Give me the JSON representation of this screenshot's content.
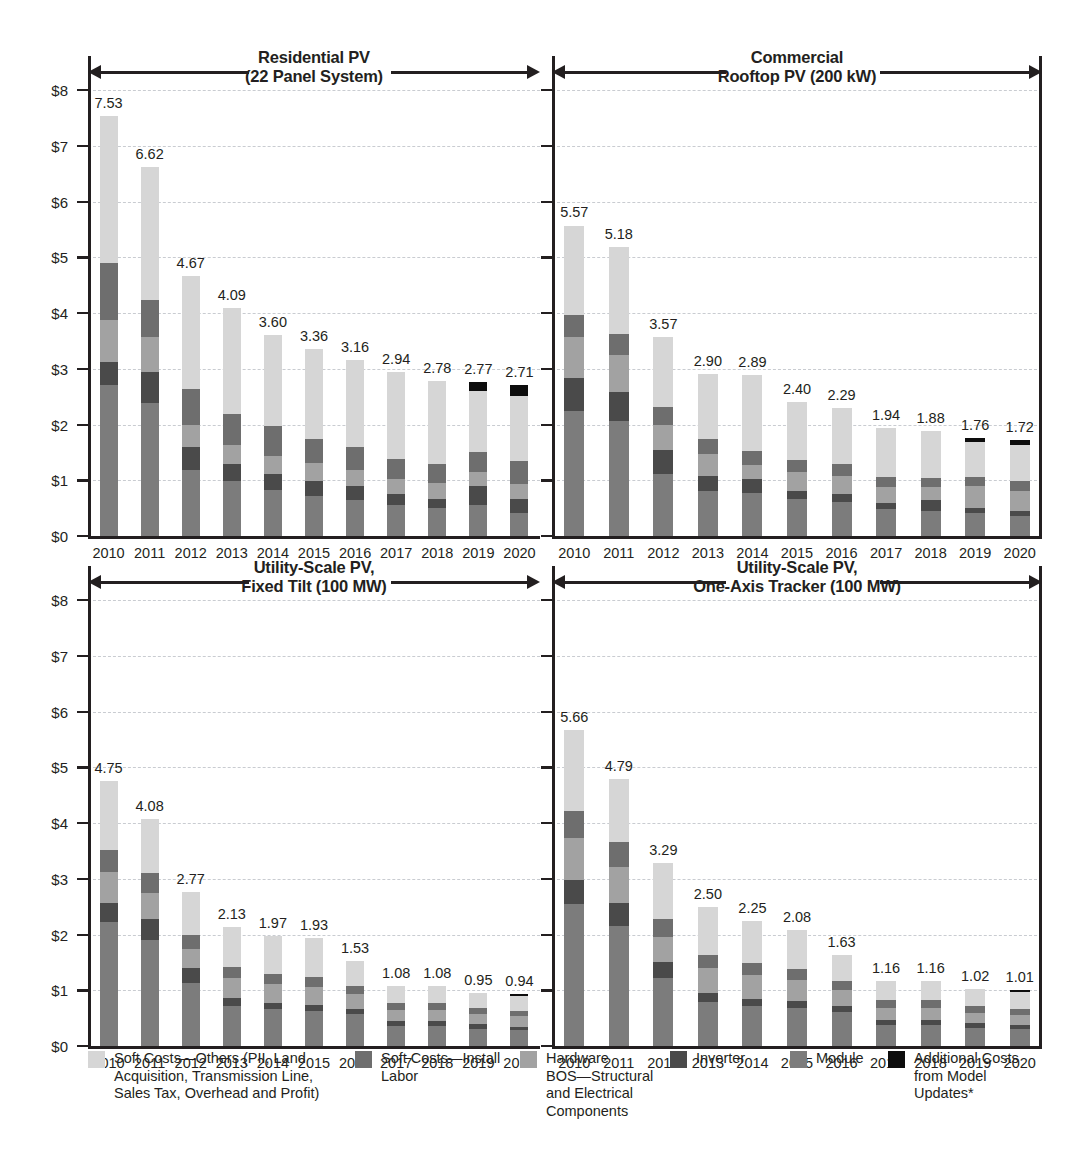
{
  "figure": {
    "y_axis": {
      "ticks": [
        "$0",
        "$1",
        "$2",
        "$3",
        "$4",
        "$5",
        "$6",
        "$7",
        "$8"
      ],
      "min": 0,
      "max": 8
    },
    "x_axis": {
      "categories": [
        "2010",
        "2011",
        "2012",
        "2013",
        "2014",
        "2015",
        "2016",
        "2017",
        "2018",
        "2019",
        "2020"
      ]
    }
  },
  "colors": {
    "soft_costs_others": "#d6d6d6",
    "soft_costs_install_labor": "#6e6e6e",
    "hardware_bos": "#a2a2a2",
    "inverter": "#4a4a4a",
    "module": "#7c7c7c",
    "additional_costs": "#0d0d0d",
    "text": "#231f20",
    "gridline": "#c9ccd1"
  },
  "legend": {
    "items": [
      {
        "name": "soft-costs-others",
        "label": "Soft Costs—Others (PII, Land\nAcquisition, Transmission Line,\nSales Tax, Overhead and Profit)",
        "color": "#d6d6d6"
      },
      {
        "name": "soft-costs-install-labor",
        "label": "Soft Costs—Install\nLabor",
        "color": "#6e6e6e"
      },
      {
        "name": "hardware-bos",
        "label": "Hardware\nBOS—Structural\nand Electrical\nComponents",
        "color": "#a2a2a2"
      },
      {
        "name": "inverter",
        "label": "Inverter",
        "color": "#4a4a4a"
      },
      {
        "name": "module",
        "label": "Module",
        "color": "#7c7c7c"
      },
      {
        "name": "additional-costs-from-model-updates",
        "label": "Additional Costs\nfrom Model\nUpdates*",
        "color": "#0d0d0d"
      }
    ]
  },
  "chart_data": [
    {
      "type": "bar",
      "stacked": true,
      "panel": "residential",
      "title": "Residential PV\n(22 Panel System)",
      "xlabel": "",
      "ylabel": "",
      "ylim": [
        0,
        8
      ],
      "grid": true,
      "categories": [
        "2010",
        "2011",
        "2012",
        "2013",
        "2014",
        "2015",
        "2016",
        "2017",
        "2018",
        "2019",
        "2020"
      ],
      "totals": [
        7.53,
        6.62,
        4.67,
        4.09,
        3.6,
        3.36,
        3.16,
        2.94,
        2.78,
        2.77,
        2.71
      ],
      "series": [
        {
          "name": "Module",
          "values": [
            2.7,
            2.38,
            1.18,
            0.98,
            0.83,
            0.72,
            0.65,
            0.56,
            0.5,
            0.56,
            0.42
          ]
        },
        {
          "name": "Inverter",
          "values": [
            0.42,
            0.57,
            0.42,
            0.31,
            0.28,
            0.27,
            0.24,
            0.19,
            0.17,
            0.33,
            0.25
          ]
        },
        {
          "name": "Hardware BOS—Structural and Electrical Components",
          "values": [
            0.75,
            0.62,
            0.39,
            0.34,
            0.33,
            0.32,
            0.3,
            0.28,
            0.28,
            0.26,
            0.27
          ]
        },
        {
          "name": "Soft Costs—Install Labor",
          "values": [
            1.03,
            0.66,
            0.64,
            0.56,
            0.53,
            0.43,
            0.41,
            0.35,
            0.34,
            0.35,
            0.4
          ]
        },
        {
          "name": "Soft Costs—Others (PII, Land Acquisition, Transmission Line, Sales Tax, Overhead and Profit)",
          "values": [
            2.63,
            2.39,
            2.04,
            1.9,
            1.63,
            1.62,
            1.56,
            1.56,
            1.49,
            1.11,
            1.17
          ]
        },
        {
          "name": "Additional Costs from Model Updates*",
          "values": [
            0,
            0,
            0,
            0,
            0,
            0,
            0,
            0,
            0,
            0.16,
            0.2
          ]
        }
      ]
    },
    {
      "type": "bar",
      "stacked": true,
      "panel": "commercial",
      "title": "Commercial\nRooftop PV (200 kW)",
      "xlabel": "",
      "ylabel": "",
      "ylim": [
        0,
        8
      ],
      "grid": true,
      "categories": [
        "2010",
        "2011",
        "2012",
        "2013",
        "2014",
        "2015",
        "2016",
        "2017",
        "2018",
        "2019",
        "2020"
      ],
      "totals": [
        5.57,
        5.18,
        3.57,
        2.9,
        2.89,
        2.4,
        2.29,
        1.94,
        1.88,
        1.76,
        1.72
      ],
      "series": [
        {
          "name": "Module",
          "values": [
            2.24,
            2.06,
            1.12,
            0.81,
            0.77,
            0.66,
            0.61,
            0.48,
            0.45,
            0.41,
            0.36
          ]
        },
        {
          "name": "Inverter",
          "values": [
            0.6,
            0.53,
            0.42,
            0.27,
            0.25,
            0.15,
            0.14,
            0.12,
            0.19,
            0.1,
            0.08
          ]
        },
        {
          "name": "Hardware BOS—Structural and Electrical Components",
          "values": [
            0.73,
            0.66,
            0.46,
            0.39,
            0.25,
            0.33,
            0.33,
            0.28,
            0.24,
            0.38,
            0.37
          ]
        },
        {
          "name": "Soft Costs—Install Labor",
          "values": [
            0.4,
            0.37,
            0.32,
            0.27,
            0.26,
            0.22,
            0.21,
            0.17,
            0.16,
            0.16,
            0.17
          ]
        },
        {
          "name": "Soft Costs—Others (PII, Land Acquisition, Transmission Line, Sales Tax, Overhead and Profit)",
          "values": [
            1.6,
            1.56,
            1.25,
            1.16,
            1.36,
            1.04,
            1.0,
            0.89,
            0.84,
            0.63,
            0.65
          ]
        },
        {
          "name": "Additional Costs from Model Updates*",
          "values": [
            0,
            0,
            0,
            0,
            0,
            0,
            0,
            0,
            0,
            0.08,
            0.09
          ]
        }
      ]
    },
    {
      "type": "bar",
      "stacked": true,
      "panel": "utility-fixed-tilt",
      "title": "Utility-Scale PV,\nFixed Tilt (100 MW)",
      "xlabel": "",
      "ylabel": "",
      "ylim": [
        0,
        8
      ],
      "grid": true,
      "categories": [
        "2010",
        "2011",
        "2012",
        "2013",
        "2014",
        "2015",
        "2016",
        "2017",
        "2018",
        "2019",
        "2020"
      ],
      "totals": [
        4.75,
        4.08,
        2.77,
        2.13,
        1.97,
        1.93,
        1.53,
        1.08,
        1.08,
        0.95,
        0.94
      ],
      "series": [
        {
          "name": "Module",
          "values": [
            2.22,
            1.9,
            1.13,
            0.72,
            0.66,
            0.63,
            0.57,
            0.36,
            0.36,
            0.31,
            0.28
          ]
        },
        {
          "name": "Inverter",
          "values": [
            0.35,
            0.37,
            0.27,
            0.15,
            0.12,
            0.11,
            0.1,
            0.09,
            0.09,
            0.08,
            0.07
          ]
        },
        {
          "name": "Hardware BOS—Structural and Electrical Components",
          "values": [
            0.55,
            0.48,
            0.34,
            0.35,
            0.33,
            0.32,
            0.26,
            0.2,
            0.2,
            0.18,
            0.18
          ]
        },
        {
          "name": "Soft Costs—Install Labor",
          "values": [
            0.4,
            0.36,
            0.25,
            0.2,
            0.19,
            0.18,
            0.15,
            0.12,
            0.12,
            0.11,
            0.1
          ]
        },
        {
          "name": "Soft Costs—Others (PII, Land Acquisition, Transmission Line, Sales Tax, Overhead and Profit)",
          "values": [
            1.23,
            0.97,
            0.78,
            0.71,
            0.67,
            0.69,
            0.45,
            0.31,
            0.31,
            0.27,
            0.27
          ]
        },
        {
          "name": "Additional Costs from Model Updates*",
          "values": [
            0,
            0,
            0,
            0,
            0,
            0,
            0,
            0,
            0,
            0,
            0.04
          ]
        }
      ]
    },
    {
      "type": "bar",
      "stacked": true,
      "panel": "utility-one-axis-tracker",
      "title": "Utility-Scale PV,\nOne-Axis Tracker (100 MW)",
      "xlabel": "",
      "ylabel": "",
      "ylim": [
        0,
        8
      ],
      "grid": true,
      "categories": [
        "2010",
        "2011",
        "2012",
        "2013",
        "2014",
        "2015",
        "2016",
        "2017",
        "2018",
        "2019",
        "2020"
      ],
      "totals": [
        5.66,
        4.79,
        3.29,
        2.5,
        2.25,
        2.08,
        1.63,
        1.16,
        1.16,
        1.02,
        1.01
      ],
      "series": [
        {
          "name": "Module",
          "values": [
            2.55,
            2.15,
            1.22,
            0.79,
            0.72,
            0.68,
            0.61,
            0.38,
            0.38,
            0.33,
            0.3
          ]
        },
        {
          "name": "Inverter",
          "values": [
            0.43,
            0.42,
            0.29,
            0.16,
            0.13,
            0.12,
            0.11,
            0.09,
            0.09,
            0.08,
            0.07
          ]
        },
        {
          "name": "Hardware BOS—Structural and Electrical Components",
          "values": [
            0.75,
            0.64,
            0.45,
            0.45,
            0.42,
            0.38,
            0.28,
            0.22,
            0.22,
            0.19,
            0.19
          ]
        },
        {
          "name": "Soft Costs—Install Labor",
          "values": [
            0.48,
            0.45,
            0.31,
            0.23,
            0.22,
            0.2,
            0.16,
            0.13,
            0.13,
            0.12,
            0.11
          ]
        },
        {
          "name": "Soft Costs—Others (PII, Land Acquisition, Transmission Line, Sales Tax, Overhead and Profit)",
          "values": [
            1.45,
            1.13,
            1.02,
            0.87,
            0.76,
            0.7,
            0.47,
            0.34,
            0.34,
            0.3,
            0.3
          ]
        },
        {
          "name": "Additional Costs from Model Updates*",
          "values": [
            0,
            0,
            0,
            0,
            0,
            0,
            0,
            0,
            0,
            0,
            0.04
          ]
        }
      ]
    }
  ]
}
